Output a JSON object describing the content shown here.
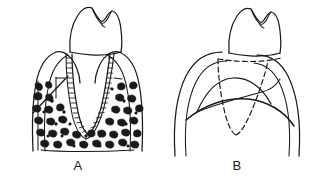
{
  "figure": {
    "kind": "line-drawing",
    "background_color": "#ffffff",
    "ink_color": "#1a1a1a",
    "panels": [
      {
        "id": "A",
        "label": "A",
        "label_x": 78,
        "label_y": 169,
        "caption_position": "below",
        "view": "buccolingual-cross-section",
        "features": [
          "tooth-crown-with-two-cusps",
          "conical-root",
          "periodontal-ligament-space",
          "lamina-dura",
          "cancellous-trabecular-bone",
          "cortical-bone-plate",
          "gingival-margin",
          "interdental-bone-crest",
          "x-ray-beam-direction-line"
        ]
      },
      {
        "id": "B",
        "label": "B",
        "label_x": 237,
        "label_y": 169,
        "caption_position": "below",
        "view": "projected-radiographic-outline",
        "features": [
          "tooth-crown-with-two-cusps",
          "root-outline-hidden-dashed",
          "cementoenamel-junction-dashed",
          "superimposed-bone-crest-curves",
          "cortical-plate-outlines"
        ]
      }
    ]
  },
  "labels": {
    "panel_a": "A",
    "panel_b": "B"
  },
  "colors": {
    "ink": "#1a1a1a",
    "background": "#ffffff"
  }
}
